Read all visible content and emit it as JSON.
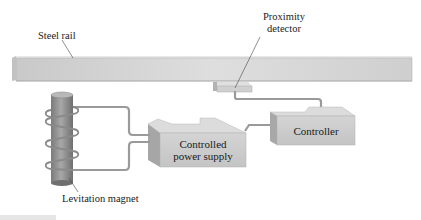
{
  "diagram": {
    "labels": {
      "steel_rail": "Steel rail",
      "proximity_detector_line1": "Proximity",
      "proximity_detector_line2": "detector",
      "controller": "Controller",
      "power_supply_line1": "Controlled",
      "power_supply_line2": "power supply",
      "levitation_magnet": "Levitation magnet"
    },
    "components": [
      {
        "id": "steel-rail",
        "label": "Steel rail"
      },
      {
        "id": "proximity-detector",
        "label": "Proximity detector"
      },
      {
        "id": "controller",
        "label": "Controller"
      },
      {
        "id": "controlled-power-supply",
        "label": "Controlled power supply"
      },
      {
        "id": "levitation-magnet",
        "label": "Levitation magnet"
      }
    ],
    "connections": [
      {
        "from": "proximity-detector",
        "to": "controller"
      },
      {
        "from": "controller",
        "to": "controlled-power-supply"
      },
      {
        "from": "controlled-power-supply",
        "to": "levitation-magnet"
      }
    ],
    "colors": {
      "rail_face": "#d2d2d2",
      "rail_top": "#e9e9e9",
      "box_face": "#c8c8c8",
      "box_top": "#dedede",
      "box_side": "#a9a9a9",
      "magnet": "#8e8e8e",
      "wire": "#9a9a9a"
    }
  }
}
